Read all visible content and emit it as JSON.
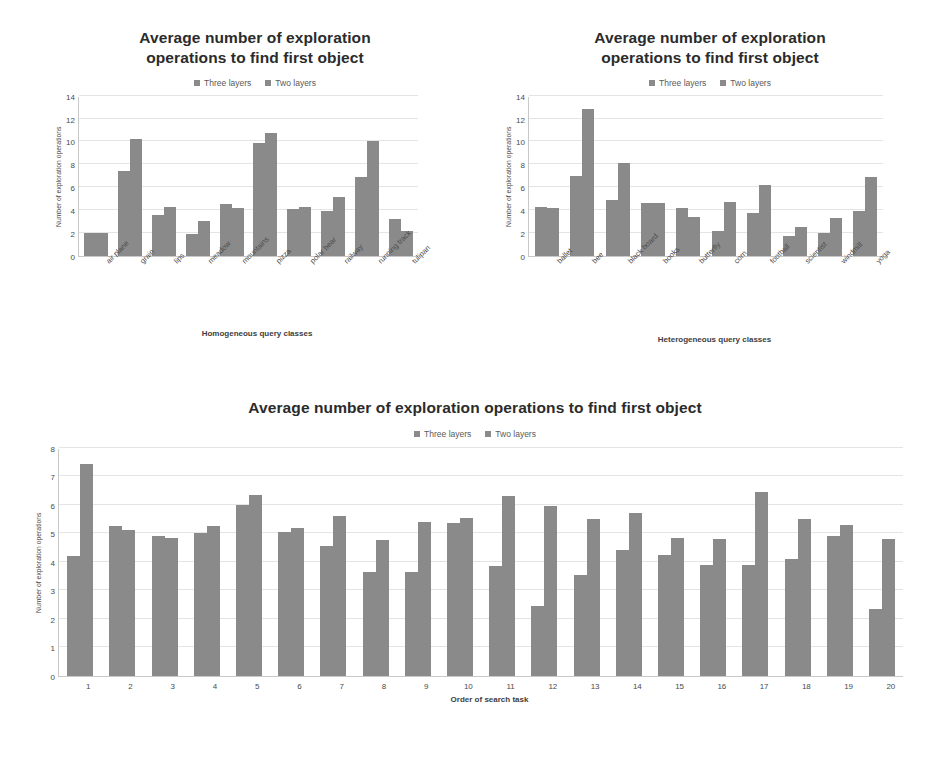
{
  "legend": {
    "series": [
      {
        "name": "Three layers",
        "color": "#8a8a8a"
      },
      {
        "name": "Two layers",
        "color": "#8a8a8a"
      }
    ]
  },
  "charts": [
    {
      "id": "homogeneous",
      "title_line1": "Average number of exploration",
      "title_line2": "operations to find first object"
    },
    {
      "id": "heterogeneous",
      "title_line1": "Average number of exploration",
      "title_line2": "operations to find first object"
    },
    {
      "id": "search-order",
      "title_line1": "Average number of exploration operations to find first object"
    }
  ],
  "chart_data": [
    {
      "type": "bar",
      "id": "homogeneous",
      "title": "Average number of exploration operations to find first object",
      "xlabel": "Homogeneous query classes",
      "ylabel": "Number of exploration operations",
      "ylim": [
        0,
        14
      ],
      "yticks": [
        0,
        2,
        4,
        6,
        8,
        10,
        12,
        14
      ],
      "grid": true,
      "legend_position": "top",
      "categories": [
        "air plane",
        "grain",
        "lips",
        "meadow",
        "mountains",
        "pizza",
        "polar bear",
        "railway",
        "running track",
        "tulipan"
      ],
      "series": [
        {
          "name": "Three layers",
          "values": [
            2.0,
            7.4,
            3.6,
            1.9,
            4.5,
            9.9,
            4.1,
            3.9,
            6.9,
            3.2
          ]
        },
        {
          "name": "Two layers",
          "values": [
            2.0,
            10.2,
            4.3,
            3.0,
            4.2,
            10.7,
            4.3,
            5.1,
            10.0,
            2.2
          ]
        }
      ]
    },
    {
      "type": "bar",
      "id": "heterogeneous",
      "title": "Average number of exploration operations to find first object",
      "xlabel": "Heterogeneous query classes",
      "ylabel": "Number of exploration operations",
      "ylim": [
        0,
        14
      ],
      "yticks": [
        0,
        2,
        4,
        6,
        8,
        10,
        12,
        14
      ],
      "grid": true,
      "legend_position": "top",
      "categories": [
        "ballet",
        "bee",
        "black board",
        "books",
        "butterfly",
        "corn",
        "football",
        "scientist",
        "windmill",
        "yoga"
      ],
      "series": [
        {
          "name": "Three layers",
          "values": [
            4.3,
            7.0,
            4.9,
            4.6,
            4.2,
            2.2,
            3.7,
            1.7,
            2.0,
            3.9
          ]
        },
        {
          "name": "Two layers",
          "values": [
            4.2,
            12.8,
            8.1,
            4.6,
            3.4,
            4.7,
            6.2,
            2.5,
            3.3,
            6.9
          ]
        }
      ]
    },
    {
      "type": "bar",
      "id": "search-order",
      "title": "Average number of exploration operations to find first object",
      "xlabel": "Order of search task",
      "ylabel": "Number of exploration operations",
      "ylim": [
        0,
        8
      ],
      "yticks": [
        0,
        1,
        2,
        3,
        4,
        5,
        6,
        7,
        8
      ],
      "grid": true,
      "legend_position": "top",
      "categories": [
        "1",
        "2",
        "3",
        "4",
        "5",
        "6",
        "7",
        "8",
        "9",
        "10",
        "11",
        "12",
        "13",
        "14",
        "15",
        "16",
        "17",
        "18",
        "19",
        "20"
      ],
      "series": [
        {
          "name": "Three layers",
          "values": [
            4.2,
            5.25,
            4.9,
            5.0,
            6.0,
            5.05,
            4.55,
            3.65,
            3.65,
            5.35,
            3.85,
            2.45,
            3.55,
            4.4,
            4.25,
            3.9,
            3.9,
            4.1,
            4.9,
            2.35
          ]
        },
        {
          "name": "Two layers",
          "values": [
            7.45,
            5.1,
            4.85,
            5.25,
            6.35,
            5.2,
            5.6,
            4.75,
            5.4,
            5.55,
            6.3,
            5.95,
            5.5,
            5.7,
            4.85,
            4.8,
            6.45,
            5.5,
            5.3,
            4.8
          ]
        }
      ]
    }
  ]
}
